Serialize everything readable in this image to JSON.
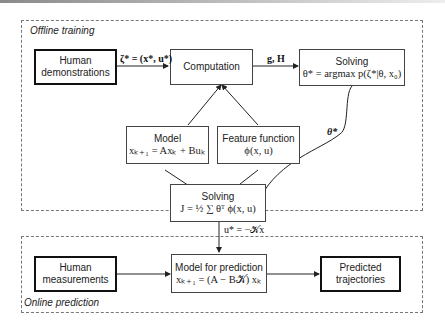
{
  "regions": {
    "offline": {
      "label": "Offline training"
    },
    "online": {
      "label": "Online prediction"
    }
  },
  "nodes": {
    "human_demonstrations": {
      "line1": "Human",
      "line2": "demonstrations"
    },
    "computation": {
      "title": "Computation"
    },
    "solving_top": {
      "title": "Solving",
      "formula": "θ* = argmax p(ζ*|θ, x₀)"
    },
    "model": {
      "title": "Model",
      "formula": "xₖ₊₁ = Axₖ + Buₖ"
    },
    "feature_function": {
      "title": "Feature function",
      "formula": "ϕ(x, u)"
    },
    "solving_bottom": {
      "title": "Solving",
      "formula": "J = ½ ∑ θᵀ ϕ(x, u)"
    },
    "human_measurements": {
      "line1": "Human",
      "line2": "measurements"
    },
    "model_prediction": {
      "title": "Model for prediction",
      "formula": "xₖ₊₁ = (A − B𝒦) xₖ"
    },
    "predicted_trajectories": {
      "line1": "Predicted",
      "line2": "trajectories"
    }
  },
  "edges": {
    "demo_to_computation": "ζ* = (x*, u*)",
    "computation_to_solving": "g, H",
    "theta_star": "θ*",
    "control_law": "u* = −𝒦x"
  },
  "colors": {
    "border": "#444444",
    "thick_border": "#111111",
    "dashed": "#777777",
    "arrow": "#222222"
  }
}
